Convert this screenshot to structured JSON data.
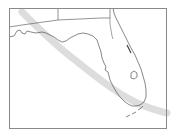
{
  "map": {
    "region": "Florida",
    "colors": {
      "background": "#ffffff",
      "frame": "#8a8a8a",
      "outline": "#555555",
      "band": "#d6d6d6"
    },
    "features": [
      {
        "name": "state-boundary-florida",
        "type": "outline"
      },
      {
        "name": "state-boundary-georgia-alabama",
        "type": "border"
      },
      {
        "name": "lake-okeechobee",
        "type": "lake"
      },
      {
        "name": "florida-keys",
        "type": "islands"
      },
      {
        "name": "path-band",
        "type": "shaded-band"
      }
    ]
  }
}
